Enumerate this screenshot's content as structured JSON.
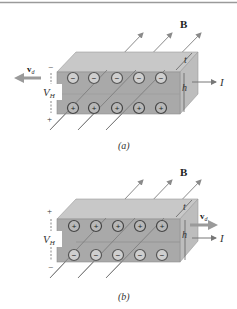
{
  "figure": {
    "top_rule_color": "#9a9a9a",
    "colors": {
      "front_face": "#a9a9a9",
      "top_face": "#c8c8c8",
      "right_face": "#bdbdbd",
      "field_line": "#8a8a8a",
      "charge_fill": "#cfcfcf",
      "charge_stroke": "#555555",
      "arrow": "#8f8f8f",
      "text": "#333333"
    },
    "panels": [
      {
        "id": "a",
        "caption": "(a)",
        "field_label": "B",
        "thickness_label": "t",
        "height_label": "h",
        "current_label": "I",
        "drift_label": "v",
        "drift_subscript": "d",
        "hall_voltage_label": "V",
        "hall_voltage_subscript": "H",
        "top_polarity": "−",
        "bottom_polarity": "+",
        "top_row_charges": [
          "−",
          "−",
          "−",
          "−",
          "−"
        ],
        "bottom_row_charges": [
          "+",
          "+",
          "+",
          "+",
          "+"
        ],
        "drift_direction": "left"
      },
      {
        "id": "b",
        "caption": "(b)",
        "field_label": "B",
        "thickness_label": "t",
        "height_label": "h",
        "current_label": "I",
        "drift_label": "v",
        "drift_subscript": "d",
        "hall_voltage_label": "V",
        "hall_voltage_subscript": "H",
        "top_polarity": "+",
        "bottom_polarity": "−",
        "top_row_charges": [
          "+",
          "+",
          "+",
          "+",
          "+"
        ],
        "bottom_row_charges": [
          "−",
          "−",
          "−",
          "−",
          "−"
        ],
        "drift_direction": "right"
      }
    ]
  }
}
